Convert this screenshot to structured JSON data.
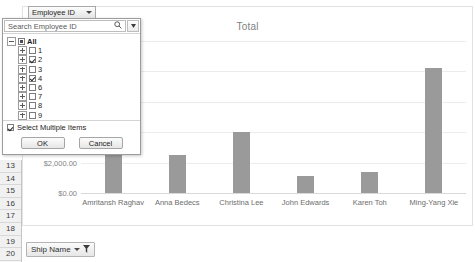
{
  "window": {
    "row_headers": [
      "13",
      "14",
      "15",
      "16",
      "17",
      "18",
      "19",
      "20"
    ]
  },
  "ship_name_cell": {
    "label": "Ship Name",
    "filter_icon": "funnel-icon",
    "caret_icon": "chevron-down-icon"
  },
  "filter_popup": {
    "column_header": "Employee ID",
    "column_header_caret": "chevron-down-icon",
    "search_placeholder": "Search Employee ID",
    "search_value": "",
    "search_icon": "magnifier-icon",
    "dropdown_icon": "chevron-down-icon",
    "select_multiple_label": "Select Multiple Items",
    "select_multiple_checked": true,
    "ok_label": "OK",
    "cancel_label": "Cancel",
    "tree": [
      {
        "label": "All",
        "state": "partial",
        "level": 0,
        "expander": "open"
      },
      {
        "label": "1",
        "state": "unchecked",
        "level": 1,
        "expander": "closed"
      },
      {
        "label": "2",
        "state": "checked",
        "level": 1,
        "expander": "closed"
      },
      {
        "label": "3",
        "state": "unchecked",
        "level": 1,
        "expander": "closed"
      },
      {
        "label": "4",
        "state": "checked",
        "level": 1,
        "expander": "closed"
      },
      {
        "label": "6",
        "state": "unchecked",
        "level": 1,
        "expander": "closed"
      },
      {
        "label": "7",
        "state": "unchecked",
        "level": 1,
        "expander": "closed"
      },
      {
        "label": "8",
        "state": "unchecked",
        "level": 1,
        "expander": "closed"
      },
      {
        "label": "9",
        "state": "unchecked",
        "level": 1,
        "expander": "closed"
      }
    ]
  },
  "chart_data": {
    "type": "bar",
    "title": "Total",
    "xlabel": "",
    "ylabel": "",
    "categories": [
      "Amritansh Raghav",
      "Anna Bedecs",
      "Christina Lee",
      "John Edwards",
      "Karen Toh",
      "Ming-Yang Xie"
    ],
    "values": [
      5400,
      2500,
      4000,
      1100,
      1400,
      8200
    ],
    "ylim": [
      0,
      10000
    ],
    "yticks": [
      0,
      2000,
      4000,
      6000,
      8000,
      10000
    ],
    "ytick_labels": [
      "$0.00",
      "$2,000.00",
      "$4,000.00",
      "$6,000.00",
      "",
      ""
    ],
    "grid": true,
    "legend": false,
    "bar_color": "#9a9a9a"
  }
}
